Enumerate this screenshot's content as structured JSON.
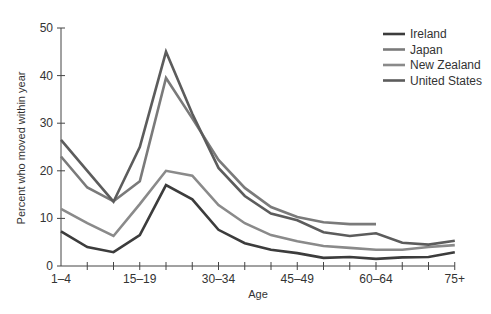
{
  "chart_data": {
    "type": "line",
    "title": "",
    "xlabel": "Age",
    "ylabel": "Percent who moved within year",
    "ylim": [
      0,
      50
    ],
    "yticks": [
      0,
      10,
      20,
      30,
      40,
      50
    ],
    "grid": false,
    "legend_position": "top-right",
    "categories": [
      "1–4",
      "5–9",
      "10–14",
      "15–19",
      "20–24",
      "25–29",
      "30–34",
      "35–39",
      "40–44",
      "45–49",
      "50–54",
      "55–59",
      "60–64",
      "65–69",
      "70–74",
      "75+"
    ],
    "x_tick_labels": [
      "1–4",
      "",
      "",
      "15–19",
      "",
      "",
      "30–34",
      "",
      "",
      "45–49",
      "",
      "",
      "60–64",
      "",
      "",
      "75+"
    ],
    "series": [
      {
        "name": "Ireland",
        "color": "#3c3c3c",
        "values": [
          7.3,
          4.0,
          2.9,
          6.5,
          17.0,
          14.0,
          7.6,
          4.8,
          3.4,
          2.7,
          1.7,
          1.9,
          1.5,
          1.8,
          1.9,
          2.9
        ]
      },
      {
        "name": "Japan",
        "color": "#7a7a7a",
        "values": [
          23.0,
          16.5,
          13.6,
          17.8,
          39.5,
          31.0,
          22.3,
          16.4,
          12.4,
          10.3,
          9.2,
          8.8,
          8.8,
          null,
          null,
          null
        ]
      },
      {
        "name": "New Zealand",
        "color": "#8a8a8a",
        "values": [
          12.0,
          9.0,
          6.3,
          13.0,
          20.0,
          19.0,
          12.8,
          9.0,
          6.5,
          5.2,
          4.2,
          3.8,
          3.4,
          3.4,
          4.0,
          4.4
        ]
      },
      {
        "name": "United States",
        "color": "#5c5c5c",
        "values": [
          26.5,
          20.0,
          13.5,
          25.0,
          45.0,
          32.0,
          20.6,
          14.7,
          11.0,
          9.6,
          7.1,
          6.3,
          6.9,
          4.9,
          4.5,
          5.3
        ]
      }
    ]
  },
  "legend": {
    "items": [
      "Ireland",
      "Japan",
      "New Zealand",
      "United States"
    ]
  },
  "axes": {
    "x_title": "Age",
    "y_title": "Percent who moved within year"
  }
}
